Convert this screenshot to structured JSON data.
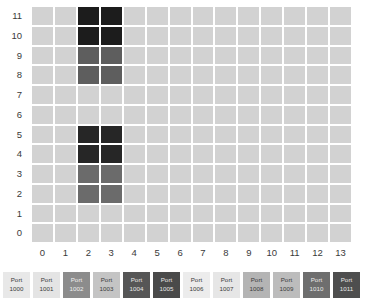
{
  "chart_data": {
    "type": "heatmap",
    "title": "",
    "xlabel": "",
    "ylabel": "",
    "x_tick_labels": [
      "0",
      "1",
      "2",
      "3",
      "4",
      "5",
      "6",
      "7",
      "8",
      "9",
      "10",
      "11",
      "12",
      "13"
    ],
    "y_tick_labels": [
      "11",
      "10",
      "9",
      "8",
      "7",
      "6",
      "5",
      "4",
      "3",
      "2",
      "1",
      "0"
    ],
    "xlim": [
      0,
      13
    ],
    "ylim": [
      0,
      11
    ],
    "n_cols": 14,
    "n_rows": 12,
    "grid": true,
    "gridline_color": "#ffffff",
    "default_cell_color": "#d2d2d2",
    "legend_position": "bottom",
    "rows_top_to_bottom": [
      {
        "y": 11,
        "colors": [
          "#d2d2d2",
          "#d2d2d2",
          "#1c1c1c",
          "#1c1c1c",
          "#d2d2d2",
          "#d2d2d2",
          "#d2d2d2",
          "#d2d2d2",
          "#d2d2d2",
          "#d2d2d2",
          "#d2d2d2",
          "#d2d2d2",
          "#d2d2d2",
          "#d2d2d2"
        ]
      },
      {
        "y": 10,
        "colors": [
          "#d2d2d2",
          "#d2d2d2",
          "#1c1c1c",
          "#1c1c1c",
          "#d2d2d2",
          "#d2d2d2",
          "#d2d2d2",
          "#d2d2d2",
          "#d2d2d2",
          "#d2d2d2",
          "#d2d2d2",
          "#d2d2d2",
          "#d2d2d2",
          "#d2d2d2"
        ]
      },
      {
        "y": 9,
        "colors": [
          "#d2d2d2",
          "#d2d2d2",
          "#5e5e5e",
          "#5e5e5e",
          "#d2d2d2",
          "#d2d2d2",
          "#d2d2d2",
          "#d2d2d2",
          "#d2d2d2",
          "#d2d2d2",
          "#d2d2d2",
          "#d2d2d2",
          "#d2d2d2",
          "#d2d2d2"
        ]
      },
      {
        "y": 8,
        "colors": [
          "#d2d2d2",
          "#d2d2d2",
          "#5e5e5e",
          "#5e5e5e",
          "#d2d2d2",
          "#d2d2d2",
          "#d2d2d2",
          "#d2d2d2",
          "#d2d2d2",
          "#d2d2d2",
          "#d2d2d2",
          "#d2d2d2",
          "#d2d2d2",
          "#d2d2d2"
        ]
      },
      {
        "y": 7,
        "colors": [
          "#d2d2d2",
          "#d2d2d2",
          "#d2d2d2",
          "#d2d2d2",
          "#d2d2d2",
          "#d2d2d2",
          "#d2d2d2",
          "#d2d2d2",
          "#d2d2d2",
          "#d2d2d2",
          "#d2d2d2",
          "#d2d2d2",
          "#d2d2d2",
          "#d2d2d2"
        ]
      },
      {
        "y": 6,
        "colors": [
          "#d2d2d2",
          "#d2d2d2",
          "#d2d2d2",
          "#d2d2d2",
          "#d2d2d2",
          "#d2d2d2",
          "#d2d2d2",
          "#d2d2d2",
          "#d2d2d2",
          "#d2d2d2",
          "#d2d2d2",
          "#d2d2d2",
          "#d2d2d2",
          "#d2d2d2"
        ]
      },
      {
        "y": 5,
        "colors": [
          "#d2d2d2",
          "#d2d2d2",
          "#262626",
          "#262626",
          "#d2d2d2",
          "#d2d2d2",
          "#d2d2d2",
          "#d2d2d2",
          "#d2d2d2",
          "#d2d2d2",
          "#d2d2d2",
          "#d2d2d2",
          "#d2d2d2",
          "#d2d2d2"
        ]
      },
      {
        "y": 4,
        "colors": [
          "#d2d2d2",
          "#d2d2d2",
          "#262626",
          "#262626",
          "#d2d2d2",
          "#d2d2d2",
          "#d2d2d2",
          "#d2d2d2",
          "#d2d2d2",
          "#d2d2d2",
          "#d2d2d2",
          "#d2d2d2",
          "#d2d2d2",
          "#d2d2d2"
        ]
      },
      {
        "y": 3,
        "colors": [
          "#d2d2d2",
          "#d2d2d2",
          "#6b6b6b",
          "#6b6b6b",
          "#d2d2d2",
          "#d2d2d2",
          "#d2d2d2",
          "#d2d2d2",
          "#d2d2d2",
          "#d2d2d2",
          "#d2d2d2",
          "#d2d2d2",
          "#d2d2d2",
          "#d2d2d2"
        ]
      },
      {
        "y": 2,
        "colors": [
          "#d2d2d2",
          "#d2d2d2",
          "#6b6b6b",
          "#6b6b6b",
          "#d2d2d2",
          "#d2d2d2",
          "#d2d2d2",
          "#d2d2d2",
          "#d2d2d2",
          "#d2d2d2",
          "#d2d2d2",
          "#d2d2d2",
          "#d2d2d2",
          "#d2d2d2"
        ]
      },
      {
        "y": 1,
        "colors": [
          "#d2d2d2",
          "#d2d2d2",
          "#d2d2d2",
          "#d2d2d2",
          "#d2d2d2",
          "#d2d2d2",
          "#d2d2d2",
          "#d2d2d2",
          "#d2d2d2",
          "#d2d2d2",
          "#d2d2d2",
          "#d2d2d2",
          "#d2d2d2",
          "#d2d2d2"
        ]
      },
      {
        "y": 0,
        "colors": [
          "#d2d2d2",
          "#d2d2d2",
          "#d2d2d2",
          "#d2d2d2",
          "#d2d2d2",
          "#d2d2d2",
          "#d2d2d2",
          "#d2d2d2",
          "#d2d2d2",
          "#d2d2d2",
          "#d2d2d2",
          "#d2d2d2",
          "#d2d2d2",
          "#d2d2d2"
        ]
      }
    ],
    "highlighted_cells": [
      {
        "x": 2,
        "y": 11,
        "color": "#1c1c1c"
      },
      {
        "x": 3,
        "y": 11,
        "color": "#1c1c1c"
      },
      {
        "x": 2,
        "y": 10,
        "color": "#1c1c1c"
      },
      {
        "x": 3,
        "y": 10,
        "color": "#1c1c1c"
      },
      {
        "x": 2,
        "y": 9,
        "color": "#5e5e5e"
      },
      {
        "x": 3,
        "y": 9,
        "color": "#5e5e5e"
      },
      {
        "x": 2,
        "y": 8,
        "color": "#5e5e5e"
      },
      {
        "x": 3,
        "y": 8,
        "color": "#5e5e5e"
      },
      {
        "x": 2,
        "y": 5,
        "color": "#262626"
      },
      {
        "x": 3,
        "y": 5,
        "color": "#262626"
      },
      {
        "x": 2,
        "y": 4,
        "color": "#262626"
      },
      {
        "x": 3,
        "y": 4,
        "color": "#262626"
      },
      {
        "x": 2,
        "y": 3,
        "color": "#6b6b6b"
      },
      {
        "x": 3,
        "y": 3,
        "color": "#6b6b6b"
      },
      {
        "x": 2,
        "y": 2,
        "color": "#6b6b6b"
      },
      {
        "x": 3,
        "y": 2,
        "color": "#6b6b6b"
      }
    ],
    "legend": [
      {
        "line1": "Port",
        "line2": "1000",
        "color": "#e8e8e8",
        "text_color": "#3a3a3a"
      },
      {
        "line1": "Port",
        "line2": "1001",
        "color": "#e4e4e4",
        "text_color": "#3a3a3a"
      },
      {
        "line1": "Port",
        "line2": "1002",
        "color": "#8c8c8c",
        "text_color": "#f0f0f0"
      },
      {
        "line1": "Port",
        "line2": "1003",
        "color": "#c4c4c4",
        "text_color": "#3a3a3a"
      },
      {
        "line1": "Port",
        "line2": "1004",
        "color": "#565656",
        "text_color": "#e8e8e8"
      },
      {
        "line1": "Port",
        "line2": "1005",
        "color": "#4a4a4a",
        "text_color": "#e8e8e8"
      },
      {
        "line1": "Port",
        "line2": "1006",
        "color": "#ececec",
        "text_color": "#3a3a3a"
      },
      {
        "line1": "Port",
        "line2": "1007",
        "color": "#e6e6e6",
        "text_color": "#3a3a3a"
      },
      {
        "line1": "Port",
        "line2": "1008",
        "color": "#b4b4b4",
        "text_color": "#3a3a3a"
      },
      {
        "line1": "Port",
        "line2": "1009",
        "color": "#bcbcbc",
        "text_color": "#3a3a3a"
      },
      {
        "line1": "Port",
        "line2": "1010",
        "color": "#6e6e6e",
        "text_color": "#eaeaea"
      },
      {
        "line1": "Port",
        "line2": "1011",
        "color": "#4e4e4e",
        "text_color": "#e8e8e8"
      }
    ]
  }
}
